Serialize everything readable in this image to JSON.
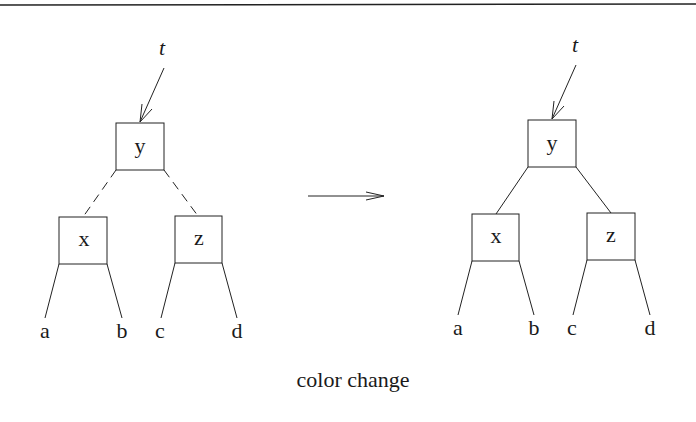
{
  "caption": "color change",
  "colors": {
    "ink": "#1a1a1a",
    "background": "#ffffff"
  },
  "trees": [
    {
      "id": "before",
      "root_pointer": "t",
      "edge_style_root_to_children": "dashed",
      "root": "y",
      "children": [
        "x",
        "z"
      ],
      "leaves": {
        "x": [
          "a",
          "b"
        ],
        "z": [
          "c",
          "d"
        ]
      }
    },
    {
      "id": "after",
      "root_pointer": "t",
      "edge_style_root_to_children": "solid",
      "root": "y",
      "children": [
        "x",
        "z"
      ],
      "leaves": {
        "x": [
          "a",
          "b"
        ],
        "z": [
          "c",
          "d"
        ]
      }
    }
  ],
  "transition_arrow": "right-arrow"
}
